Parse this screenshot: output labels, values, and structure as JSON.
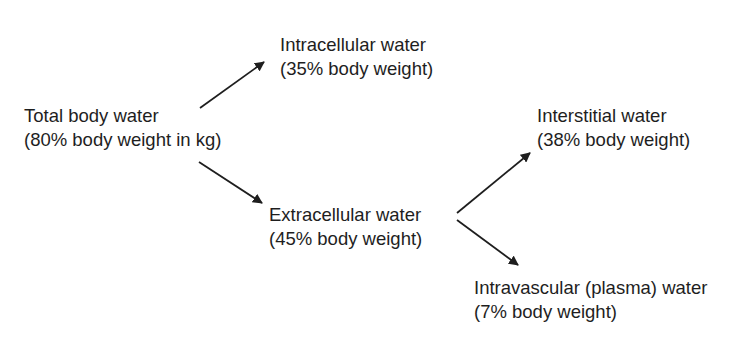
{
  "diagram": {
    "nodes": {
      "total": {
        "title": "Total body water",
        "detail": "(80% body weight in kg)"
      },
      "intracellular": {
        "title": "Intracellular water",
        "detail": "(35% body weight)"
      },
      "extracellular": {
        "title": "Extracellular water",
        "detail": "(45% body weight)"
      },
      "interstitial": {
        "title": "Interstitial water",
        "detail": "(38% body weight)"
      },
      "intravascular": {
        "title": "Intravascular (plasma) water",
        "detail": "(7% body weight)"
      }
    },
    "edges": [
      {
        "from": "total",
        "to": "intracellular"
      },
      {
        "from": "total",
        "to": "extracellular"
      },
      {
        "from": "extracellular",
        "to": "interstitial"
      },
      {
        "from": "extracellular",
        "to": "intravascular"
      }
    ],
    "colors": {
      "text": "#1e1e1e",
      "arrow": "#1e1e1e",
      "background": "#ffffff"
    }
  }
}
